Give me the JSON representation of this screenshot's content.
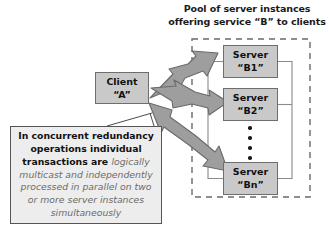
{
  "diagram": {
    "title_caption": {
      "line1": "Pool of server instances",
      "line2": "offering service “B” to clients"
    },
    "client": {
      "line1": "Client",
      "line2": "“A”"
    },
    "servers": [
      {
        "line1": "Server",
        "line2": "“B1”"
      },
      {
        "line1": "Server",
        "line2": "“B2”"
      },
      {
        "line1": "Server",
        "line2": "“Bn”"
      }
    ],
    "ellipsis_dot_count": 4,
    "callout": {
      "bold_text": "In concurrent redundancy operations individual transactions are ",
      "italic_text": "logically multicast and independently processed in parallel on two or more server instances simultaneously"
    },
    "colors": {
      "node_fill": "#c9c9c9",
      "node_stroke": "#6e6e6e",
      "arrow_fill": "#9e9e9e",
      "arrow_stroke": "#6a6a6a",
      "callout_fill": "#ededed",
      "callout_stroke": "#555555",
      "pool_boundary": "#6a6a6a",
      "text_dark": "#111111",
      "text_italic": "#6b6b6b",
      "background": "#ffffff"
    }
  }
}
